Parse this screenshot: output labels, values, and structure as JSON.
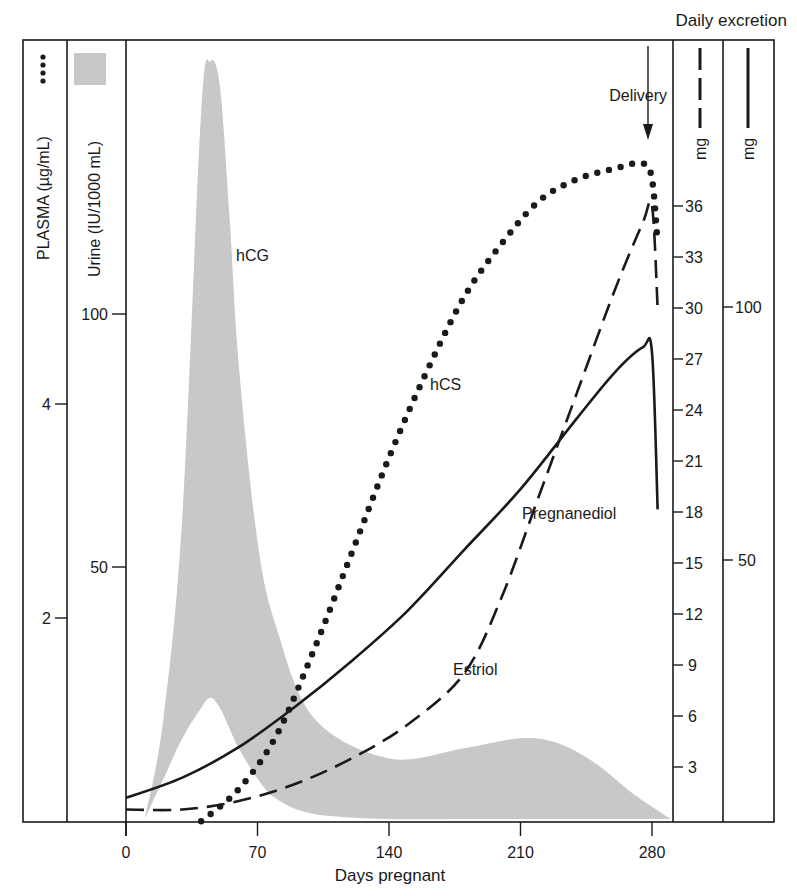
{
  "chart_data": {
    "type": "line",
    "title": "",
    "header_label": "Daily excretion",
    "xlabel": "Days pregnant",
    "x_ticks": [
      0,
      70,
      140,
      210,
      280
    ],
    "xlim": [
      0,
      290
    ],
    "annotation": {
      "text": "Delivery",
      "x": 280,
      "kind": "arrow-down"
    },
    "axes": [
      {
        "id": "plasma",
        "label": "PLASMA (µg/mL)",
        "marker": "dotted",
        "ticks": [
          2,
          4
        ],
        "side": "left"
      },
      {
        "id": "urine",
        "label": "Urine (IU/1000 mL)",
        "marker": "gray-fill",
        "ticks": [
          50,
          100
        ],
        "side": "left"
      },
      {
        "id": "estriol_mg",
        "label": "mg",
        "marker": "dashed",
        "ticks": [
          3,
          6,
          9,
          12,
          15,
          18,
          21,
          24,
          27,
          30,
          33,
          36
        ],
        "side": "right"
      },
      {
        "id": "pregnanediol_mg",
        "label": "mg",
        "marker": "solid",
        "ticks": [
          50,
          100
        ],
        "side": "right"
      }
    ],
    "series": [
      {
        "name": "hCG",
        "style": "gray-band",
        "axis": "urine",
        "x": [
          10,
          20,
          30,
          40,
          45,
          50,
          55,
          60,
          70,
          80,
          100,
          140,
          180,
          210,
          230,
          250,
          270,
          290
        ],
        "upper": [
          0,
          20,
          60,
          140,
          150,
          145,
          120,
          90,
          55,
          38,
          20,
          12,
          14,
          16,
          15,
          11,
          5,
          0
        ],
        "lower": [
          0,
          8,
          16,
          22,
          24,
          22,
          18,
          14,
          8,
          4,
          1,
          0,
          0,
          0,
          0,
          0,
          0,
          0
        ]
      },
      {
        "name": "hCS",
        "style": "dotted",
        "axis": "plasma",
        "x": [
          40,
          60,
          80,
          100,
          120,
          140,
          160,
          180,
          200,
          220,
          240,
          260,
          275,
          280,
          283
        ],
        "values": [
          0.1,
          0.4,
          0.9,
          1.7,
          2.6,
          3.5,
          4.3,
          5.0,
          5.5,
          5.9,
          6.1,
          6.2,
          6.25,
          6.1,
          5.5
        ]
      },
      {
        "name": "Estriol",
        "style": "dashed",
        "axis": "estriol_mg",
        "x": [
          0,
          30,
          60,
          90,
          120,
          150,
          180,
          200,
          220,
          240,
          260,
          275,
          280,
          283
        ],
        "values": [
          0.5,
          0.5,
          1.0,
          2.0,
          3.5,
          5.5,
          8.5,
          13,
          19,
          25,
          31,
          35,
          36,
          30
        ]
      },
      {
        "name": "Pregnanediol",
        "style": "solid",
        "axis": "pregnanediol_mg",
        "x": [
          0,
          30,
          60,
          90,
          120,
          150,
          180,
          210,
          240,
          260,
          275,
          280,
          283
        ],
        "values": [
          3,
          7,
          13,
          21,
          30,
          40,
          52,
          64,
          78,
          87,
          92,
          91,
          60
        ]
      }
    ],
    "labels": [
      {
        "text": "hCG",
        "series": "hCG"
      },
      {
        "text": "hCS",
        "series": "hCS"
      },
      {
        "text": "Pregnanediol",
        "series": "Pregnanediol"
      },
      {
        "text": "Estriol",
        "series": "Estriol"
      }
    ],
    "grid": false,
    "legend_position": "axis-headers"
  }
}
